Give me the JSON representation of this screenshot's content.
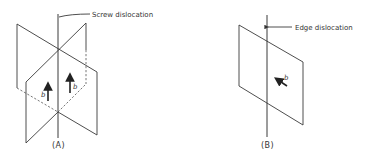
{
  "panel_a": {
    "caption": "(A)",
    "dislocation_label": "Screw dislocation",
    "burgers_labels": [
      "b",
      "b"
    ]
  },
  "panel_b": {
    "caption": "(B)",
    "dislocation_label": "Edge dislocation",
    "burgers_label": "b"
  }
}
